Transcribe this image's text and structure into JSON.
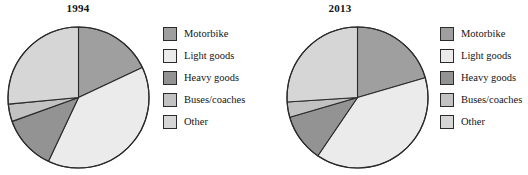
{
  "figure": {
    "background": "#ffffff",
    "outline_color": "#2b2b2b"
  },
  "legend": {
    "items": [
      {
        "label": "Motorbike",
        "color": "#9f9f9f"
      },
      {
        "label": "Light goods",
        "color": "#ebebeb"
      },
      {
        "label": "Heavy goods",
        "color": "#939393"
      },
      {
        "label": "Buses/coaches",
        "color": "#c2c2c2"
      },
      {
        "label": "Other",
        "color": "#d6d6d6"
      }
    ]
  },
  "chart_data": [
    {
      "type": "pie",
      "title": "1994",
      "categories": [
        "Motorbike",
        "Light goods",
        "Heavy goods",
        "Buses/coaches",
        "Other"
      ],
      "values": [
        18,
        39,
        12.5,
        4,
        26.5
      ],
      "colors": [
        "#9f9f9f",
        "#ebebeb",
        "#939393",
        "#c2c2c2",
        "#d6d6d6"
      ],
      "start_angle_deg": 0,
      "direction": "clockwise",
      "legend_position": "right",
      "xlabel": "",
      "ylabel": ""
    },
    {
      "type": "pie",
      "title": "2013",
      "categories": [
        "Motorbike",
        "Light goods",
        "Heavy goods",
        "Buses/coaches",
        "Other"
      ],
      "values": [
        20.5,
        39,
        11,
        3.5,
        26
      ],
      "colors": [
        "#9f9f9f",
        "#ebebeb",
        "#939393",
        "#c2c2c2",
        "#d6d6d6"
      ],
      "start_angle_deg": 0,
      "direction": "clockwise",
      "legend_position": "right",
      "xlabel": "",
      "ylabel": ""
    }
  ]
}
